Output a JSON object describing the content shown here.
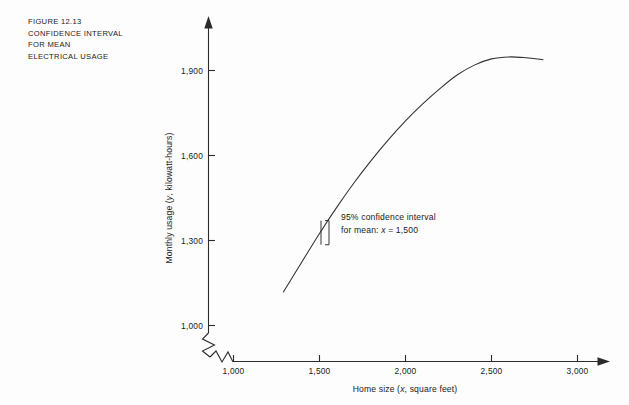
{
  "figure": {
    "caption_lines": [
      "FIGURE 12.13",
      "CONFIDENCE INTERVAL",
      "FOR MEAN",
      "ELECTRICAL USAGE"
    ]
  },
  "annotation": {
    "line1": "95% confidence interval",
    "line2_prefix": "for mean: ",
    "line2_var": "x",
    "line2_eq": "=",
    "line2_value": "1,500"
  },
  "chart_data": {
    "type": "line",
    "title": "FIGURE 12.13 CONFIDENCE INTERVAL FOR MEAN ELECTRICAL USAGE",
    "xlabel_prefix": "Home size (",
    "xlabel_var": "x",
    "xlabel_suffix": ", square feet)",
    "ylabel_prefix": "Monthly usage (",
    "ylabel_var": "y",
    "ylabel_suffix": ", kilowatt-hours)",
    "xlim": [
      1000,
      3000
    ],
    "ylim": [
      1000,
      2000
    ],
    "xticks": [
      1000,
      1500,
      2000,
      2500,
      3000
    ],
    "xtick_labels": [
      "1,000",
      "1,500",
      "2,000",
      "2,500",
      "3,000"
    ],
    "yticks": [
      1000,
      1300,
      1600,
      1900
    ],
    "ytick_labels": [
      "1,000",
      "1,300",
      "1,600",
      "1,900"
    ],
    "grid": false,
    "legend": "none",
    "axis_breaks": {
      "x_axis": true,
      "y_axis": true
    },
    "series": [
      {
        "name": "Fitted quadratic regression of monthly usage on home size",
        "x": [
          1290,
          1400,
          1500,
          1600,
          1700,
          1800,
          1900,
          2000,
          2100,
          2200,
          2300,
          2400,
          2500,
          2600,
          2700,
          2800
        ],
        "y": [
          1118,
          1227,
          1325,
          1417,
          1503,
          1582,
          1655,
          1722,
          1782,
          1836,
          1884,
          1919,
          1941,
          1948,
          1945,
          1938
        ]
      }
    ],
    "annotations": [
      {
        "name": "confidence-interval-marker",
        "text": "95% confidence interval for mean: x = 1,500",
        "at_x": 1500,
        "at_y": 1325,
        "interval_low": 1285,
        "interval_high": 1370
      }
    ]
  }
}
